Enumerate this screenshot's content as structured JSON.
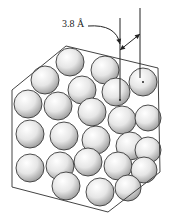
{
  "diagram": {
    "type": "close-packed crystal lattice (hexagonal prism view of stacked spheres)",
    "dimension_label": "3.8 Å",
    "colors": {
      "background": "#ffffff",
      "outline": "#444444",
      "sphere_light": "#f8f8f8",
      "sphere_dark": "#a8a8a8",
      "sphere_edge": "#3a3a3a"
    },
    "hexagon_vertices": [
      [
        66,
        46
      ],
      [
        158,
        68
      ],
      [
        160,
        172
      ],
      [
        108,
        212
      ],
      [
        12,
        187
      ],
      [
        12,
        90
      ]
    ],
    "spheres": [
      {
        "cx": 70,
        "cy": 62,
        "r": 14
      },
      {
        "cx": 105,
        "cy": 70,
        "r": 14
      },
      {
        "cx": 45,
        "cy": 80,
        "r": 14
      },
      {
        "cx": 82,
        "cy": 90,
        "r": 14
      },
      {
        "cx": 116,
        "cy": 92,
        "r": 14
      },
      {
        "cx": 143,
        "cy": 82,
        "r": 14
      },
      {
        "cx": 28,
        "cy": 104,
        "r": 14
      },
      {
        "cx": 58,
        "cy": 106,
        "r": 14
      },
      {
        "cx": 92,
        "cy": 112,
        "r": 14
      },
      {
        "cx": 122,
        "cy": 120,
        "r": 14
      },
      {
        "cx": 148,
        "cy": 118,
        "r": 13
      },
      {
        "cx": 30,
        "cy": 134,
        "r": 14
      },
      {
        "cx": 64,
        "cy": 136,
        "r": 14
      },
      {
        "cx": 96,
        "cy": 140,
        "r": 14
      },
      {
        "cx": 130,
        "cy": 146,
        "r": 14
      },
      {
        "cx": 148,
        "cy": 150,
        "r": 13
      },
      {
        "cx": 30,
        "cy": 168,
        "r": 14
      },
      {
        "cx": 60,
        "cy": 166,
        "r": 14
      },
      {
        "cx": 88,
        "cy": 162,
        "r": 14
      },
      {
        "cx": 118,
        "cy": 166,
        "r": 14
      },
      {
        "cx": 144,
        "cy": 170,
        "r": 13
      },
      {
        "cx": 66,
        "cy": 186,
        "r": 14
      },
      {
        "cx": 100,
        "cy": 192,
        "r": 14
      },
      {
        "cx": 128,
        "cy": 188,
        "r": 13
      }
    ],
    "dimension_lines": {
      "line1": {
        "x": 120,
        "y1": 18,
        "y2": 100
      },
      "line2": {
        "x": 140,
        "y1": 8,
        "y2": 78
      },
      "arrow": {
        "x1": 120,
        "y1": 50,
        "x2": 140,
        "y2": 34
      },
      "curve_from": [
        88,
        26
      ],
      "curve_to": [
        120,
        44
      ]
    }
  }
}
